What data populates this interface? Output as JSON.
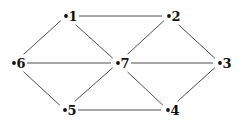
{
  "diagram": {
    "type": "graph",
    "nodes": [
      {
        "id": "1",
        "label": "1",
        "x": 66,
        "y": 16
      },
      {
        "id": "2",
        "label": "2",
        "x": 169,
        "y": 16
      },
      {
        "id": "3",
        "label": "3",
        "x": 220,
        "y": 63
      },
      {
        "id": "4",
        "label": "4",
        "x": 168,
        "y": 110
      },
      {
        "id": "5",
        "label": "5",
        "x": 65,
        "y": 110
      },
      {
        "id": "6",
        "label": "6",
        "x": 14,
        "y": 63
      },
      {
        "id": "7",
        "label": "7",
        "x": 118,
        "y": 63
      }
    ],
    "edges": [
      {
        "from": "1",
        "to": "2"
      },
      {
        "from": "1",
        "to": "6"
      },
      {
        "from": "1",
        "to": "7"
      },
      {
        "from": "2",
        "to": "7"
      },
      {
        "from": "2",
        "to": "3"
      },
      {
        "from": "6",
        "to": "7"
      },
      {
        "from": "7",
        "to": "3"
      },
      {
        "from": "6",
        "to": "5"
      },
      {
        "from": "7",
        "to": "5"
      },
      {
        "from": "7",
        "to": "4"
      },
      {
        "from": "3",
        "to": "4"
      },
      {
        "from": "5",
        "to": "4"
      }
    ]
  }
}
